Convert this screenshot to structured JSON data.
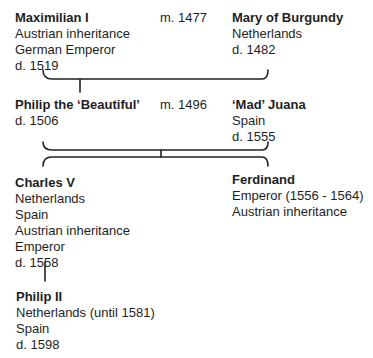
{
  "tree": {
    "generation1": {
      "left": {
        "name": "Maximilian I",
        "lines": [
          "Austrian inheritance",
          "German Emperor",
          "d. 1519"
        ]
      },
      "marriage": "m. 1477",
      "right": {
        "name": "Mary of Burgundy",
        "lines": [
          "Netherlands",
          "d. 1482"
        ]
      }
    },
    "generation2": {
      "left": {
        "name": "Philip the ‘Beautiful’",
        "lines": [
          "d. 1506"
        ]
      },
      "marriage": "m. 1496",
      "right": {
        "name": "‘Mad’ Juana",
        "lines": [
          "Spain",
          "d. 1555"
        ]
      }
    },
    "generation3": {
      "left": {
        "name": "Charles V",
        "lines": [
          "Netherlands",
          "Spain",
          "Austrian inheritance",
          "Emperor",
          "d. 1558"
        ]
      },
      "right": {
        "name": "Ferdinand",
        "lines": [
          "Emperor (1556 - 1564)",
          "Austrian inheritance"
        ]
      }
    },
    "generation4": {
      "child": {
        "name": "Philip II",
        "lines": [
          "Netherlands (until 1581)",
          "Spain",
          "d. 1598"
        ]
      }
    }
  },
  "colors": {
    "text": "#1e1e1e",
    "lines": "#222222",
    "background": "#ffffff"
  }
}
